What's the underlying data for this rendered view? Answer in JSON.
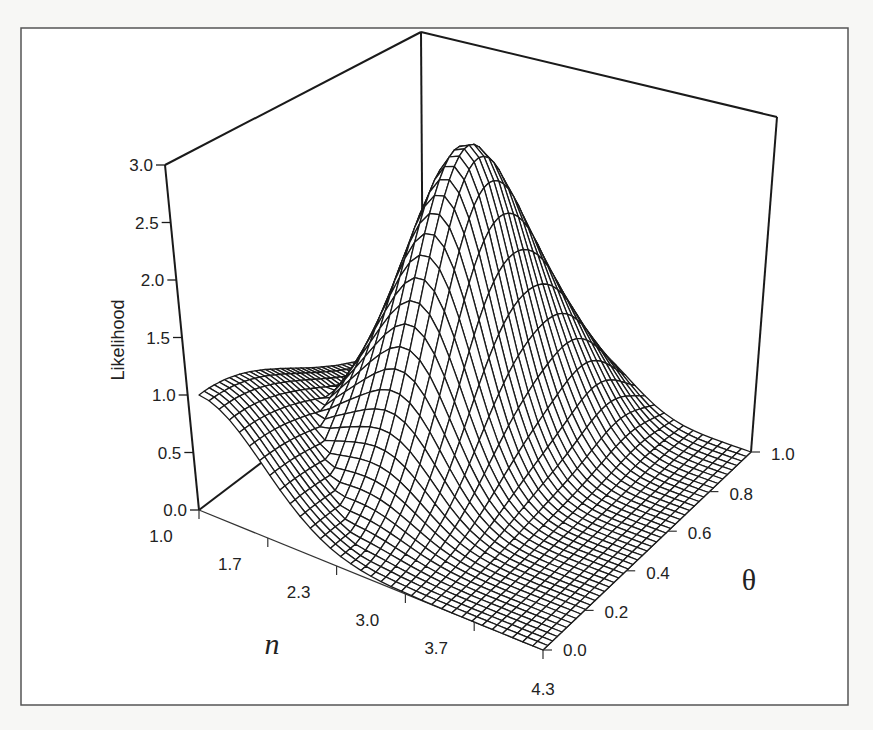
{
  "chart_data": {
    "type": "surface3d",
    "title": "",
    "zlabel": "Likelihood",
    "xlabel": "n",
    "ylabel": "θ",
    "z_ticks": [
      "0.0",
      "0.5",
      "1.0",
      "1.5",
      "2.0",
      "2.5",
      "3.0"
    ],
    "x_ticks": [
      "1.0",
      "1.7",
      "2.3",
      "3.0",
      "3.7",
      "4.3"
    ],
    "y_ticks": [
      "0.0",
      "0.2",
      "0.4",
      "0.6",
      "0.8",
      "1.0"
    ],
    "xlim": [
      1.0,
      4.3
    ],
    "ylim": [
      0.0,
      1.0
    ],
    "zlim": [
      0.0,
      3.0
    ],
    "grid": false,
    "style": "wireframe",
    "surface": {
      "description": "Likelihood surface over n and theta; peak ~2.8 near n≈2.3, theta≈0.65; value ~1.0 at n=1.0, theta=0; decays toward 0 as n→4.3 and theta→0",
      "peak": {
        "n": 2.3,
        "theta": 0.65,
        "z": 2.8
      },
      "samples": [
        {
          "n": 1.0,
          "theta": 0.0,
          "z": 1.0
        },
        {
          "n": 1.7,
          "theta": 0.5,
          "z": 2.2
        },
        {
          "n": 2.3,
          "theta": 0.65,
          "z": 2.8
        },
        {
          "n": 3.0,
          "theta": 0.8,
          "z": 1.6
        },
        {
          "n": 3.7,
          "theta": 0.9,
          "z": 0.4
        },
        {
          "n": 4.3,
          "theta": 1.0,
          "z": 0.05
        },
        {
          "n": 4.3,
          "theta": 0.0,
          "z": 0.0
        }
      ]
    }
  },
  "axes": {
    "z_label": "Likelihood",
    "x_label": "n",
    "y_label": "θ"
  },
  "colors": {
    "line": "#1a1a1a",
    "frame": "#555555",
    "background": "#f7f7f5"
  }
}
